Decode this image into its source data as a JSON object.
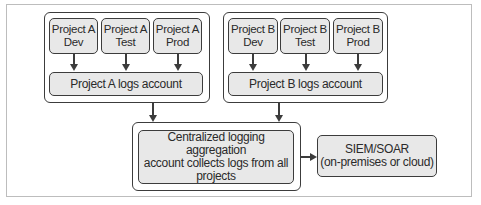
{
  "diagram": {
    "group_a": {
      "nodes": [
        {
          "label": "Project A\nDev"
        },
        {
          "label": "Project A\nTest"
        },
        {
          "label": "Project A\nProd"
        }
      ],
      "logs_account": "Project A logs account"
    },
    "group_b": {
      "nodes": [
        {
          "label": "Project B\nDev"
        },
        {
          "label": "Project B\nTest"
        },
        {
          "label": "Project B\nProd"
        }
      ],
      "logs_account": "Project B logs account"
    },
    "central": {
      "label": "Centralized logging aggregation\naccount collects logs from all\nprojects"
    },
    "siem": {
      "label": "SIEM/SOAR\n(on-premises or cloud)"
    },
    "colors": {
      "node_fill": "#e8e8e8",
      "stroke": "#3c3c3c",
      "frame": "#bdbdbd"
    }
  }
}
